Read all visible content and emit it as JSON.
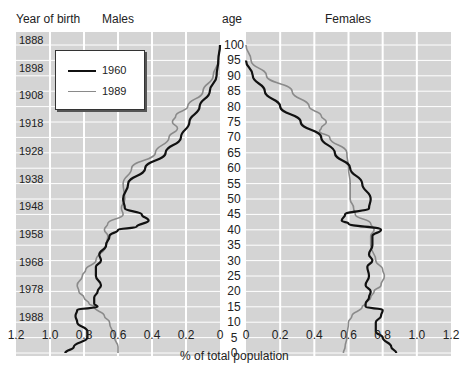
{
  "chart_data": {
    "type": "line",
    "title": "",
    "subtitle": "Population pyramid by age (1960 vs 1989)",
    "xlabel": "% of total population",
    "ylabel": "age",
    "panels": {
      "left_title": "Males",
      "right_title": "Females",
      "left_axis_title": "Year of birth"
    },
    "x_ticks_left": [
      "1.2",
      "1.0",
      "0.8",
      "0.6",
      "0.4",
      "0.2",
      "0"
    ],
    "x_ticks_right": [
      "0",
      "0.2",
      "0.4",
      "0.6",
      "0.8",
      "1.0",
      "1.2"
    ],
    "xlim": [
      0,
      1.2
    ],
    "age_ticks": [
      "100",
      "95",
      "90",
      "85",
      "80",
      "75",
      "70",
      "65",
      "60",
      "55",
      "50",
      "45",
      "40",
      "35",
      "30",
      "25",
      "20",
      "15",
      "10",
      "5",
      "0"
    ],
    "ylim": [
      0,
      100
    ],
    "year_of_birth_ticks": [
      "1888",
      "1898",
      "1908",
      "1918",
      "1928",
      "1938",
      "1948",
      "1958",
      "1968",
      "1978",
      "1988"
    ],
    "grid": true,
    "legend": {
      "position": "upper-left (males panel)",
      "entries": [
        "1960",
        "1989"
      ]
    },
    "series": [
      {
        "name": "1960",
        "color": "#111111",
        "males": {
          "age": [
            100,
            95,
            90,
            85,
            80,
            75,
            70,
            65,
            60,
            55,
            50,
            47,
            45,
            43,
            41,
            40,
            38,
            35,
            32,
            30,
            28,
            25,
            22,
            20,
            18,
            16,
            15,
            14,
            12,
            10,
            7,
            5,
            2,
            0
          ],
          "pct": [
            0.0,
            0.01,
            0.02,
            0.06,
            0.12,
            0.18,
            0.23,
            0.32,
            0.44,
            0.54,
            0.57,
            0.56,
            0.46,
            0.42,
            0.49,
            0.6,
            0.65,
            0.67,
            0.71,
            0.7,
            0.73,
            0.73,
            0.7,
            0.72,
            0.74,
            0.74,
            0.72,
            0.84,
            0.85,
            0.84,
            0.78,
            0.78,
            0.86,
            0.91
          ]
        },
        "females": {
          "age": [
            95,
            90,
            85,
            80,
            75,
            70,
            65,
            60,
            55,
            50,
            47,
            45,
            43,
            42,
            40,
            38,
            35,
            32,
            30,
            28,
            25,
            22,
            20,
            18,
            16,
            15,
            14,
            12,
            10,
            7,
            5,
            2,
            0
          ],
          "pct": [
            0.0,
            0.04,
            0.11,
            0.2,
            0.32,
            0.44,
            0.52,
            0.61,
            0.68,
            0.73,
            0.72,
            0.58,
            0.56,
            0.6,
            0.79,
            0.74,
            0.74,
            0.72,
            0.74,
            0.71,
            0.72,
            0.7,
            0.73,
            0.72,
            0.7,
            0.7,
            0.8,
            0.79,
            0.76,
            0.76,
            0.8,
            0.85,
            0.88
          ]
        }
      },
      {
        "name": "1989",
        "color": "#8a8a8a",
        "males": {
          "age": [
            100,
            95,
            90,
            85,
            80,
            77,
            75,
            73,
            70,
            65,
            60,
            55,
            50,
            47,
            45,
            42,
            40,
            38,
            35,
            30,
            27,
            25,
            22,
            20,
            18,
            16,
            15,
            12,
            10,
            5,
            2,
            0
          ],
          "pct": [
            0.0,
            0.01,
            0.04,
            0.1,
            0.19,
            0.26,
            0.28,
            0.25,
            0.3,
            0.38,
            0.52,
            0.57,
            0.56,
            0.58,
            0.57,
            0.66,
            0.68,
            0.66,
            0.67,
            0.73,
            0.79,
            0.81,
            0.84,
            0.83,
            0.8,
            0.77,
            0.74,
            0.68,
            0.65,
            0.62,
            0.6,
            0.6
          ]
        },
        "females": {
          "age": [
            100,
            95,
            90,
            85,
            80,
            77,
            75,
            73,
            72,
            70,
            65,
            60,
            55,
            50,
            47,
            45,
            42,
            40,
            38,
            35,
            30,
            27,
            25,
            22,
            20,
            18,
            16,
            15,
            12,
            10,
            5,
            2,
            0
          ],
          "pct": [
            0.0,
            0.03,
            0.12,
            0.27,
            0.37,
            0.44,
            0.47,
            0.44,
            0.43,
            0.49,
            0.59,
            0.6,
            0.61,
            0.61,
            0.63,
            0.64,
            0.73,
            0.75,
            0.73,
            0.73,
            0.76,
            0.8,
            0.81,
            0.79,
            0.75,
            0.73,
            0.7,
            0.68,
            0.62,
            0.6,
            0.59,
            0.58,
            0.57
          ]
        }
      }
    ],
    "colors": {
      "plot_background": "#d4d4d4",
      "grid": "#ffffff",
      "series_1960": "#111111",
      "series_1989": "#8a8a8a"
    }
  }
}
